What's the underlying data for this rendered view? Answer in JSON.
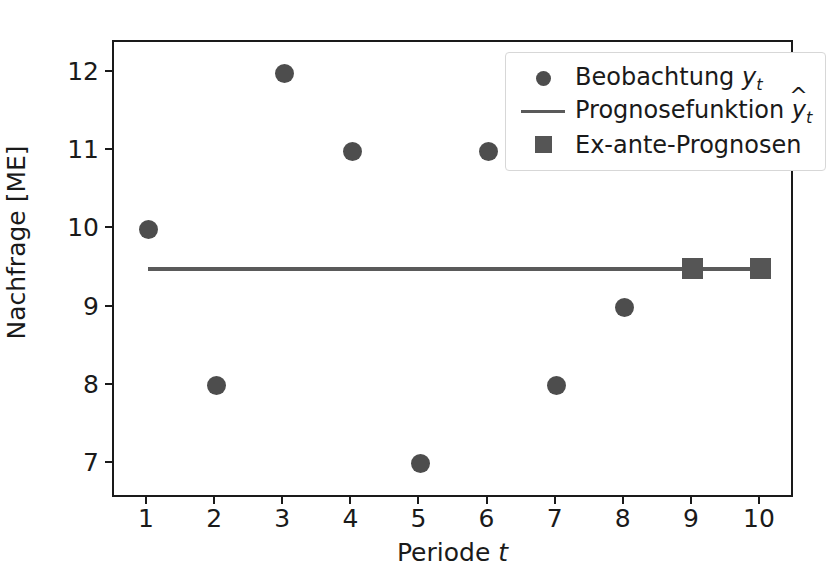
{
  "chart_data": {
    "type": "scatter",
    "title": "",
    "xlabel": "Periode t",
    "ylabel": "Nachfrage [ME]",
    "xlim": [
      0.5,
      10.5
    ],
    "ylim": [
      6.55,
      12.4
    ],
    "xticks": [
      "1",
      "2",
      "3",
      "4",
      "5",
      "6",
      "7",
      "8",
      "9",
      "10"
    ],
    "yticks": [
      "7",
      "8",
      "9",
      "10",
      "11",
      "12"
    ],
    "grid": false,
    "legend_position": "upper right",
    "series": [
      {
        "name": "Beobachtung y_t",
        "legend_label": "Beobachtung y",
        "legend_label_sub": "t",
        "marker": "circle",
        "color": "#4d4d4d",
        "x": [
          1,
          2,
          3,
          4,
          5,
          6,
          7,
          8
        ],
        "values": [
          10,
          8,
          12,
          11,
          7,
          11,
          8,
          9
        ]
      },
      {
        "name": "Prognosefunktion yhat_t",
        "legend_label": "Prognosefunktion y",
        "legend_label_hat": "^",
        "legend_label_sub": "t",
        "marker": "line",
        "color": "#5a5a5a",
        "x": [
          1,
          10
        ],
        "values": [
          9.5,
          9.5
        ]
      },
      {
        "name": "Ex-ante-Prognosen",
        "legend_label": "Ex-ante-Prognosen",
        "marker": "square",
        "color": "#555555",
        "x": [
          9,
          10
        ],
        "values": [
          9.5,
          9.5
        ]
      }
    ]
  },
  "axes": {
    "xlabel_text": "Periode ",
    "xlabel_var": "t",
    "ylabel_text": "Nachfrage [ME]"
  },
  "colors": {
    "frame": "#1a1a1a",
    "marker": "#4d4d4d",
    "square": "#555555",
    "line": "#5a5a5a",
    "legend_border": "#d7d7d7",
    "background": "#ffffff"
  }
}
